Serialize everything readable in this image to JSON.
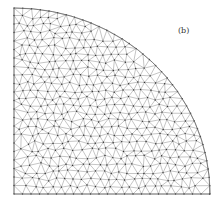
{
  "figure": {
    "label": "(b)",
    "label_pos": {
      "x": 178,
      "y": 26
    },
    "domain_shape": "quarter-circle",
    "center": {
      "x": 14,
      "y": 194
    },
    "rx": 196,
    "ry": 186,
    "mesh": {
      "type": "unstructured triangular",
      "node_spacing_px": 8.5,
      "edge_color": "#8a8a8a",
      "node_color": "#333333",
      "boundary_color": "#666666"
    }
  }
}
